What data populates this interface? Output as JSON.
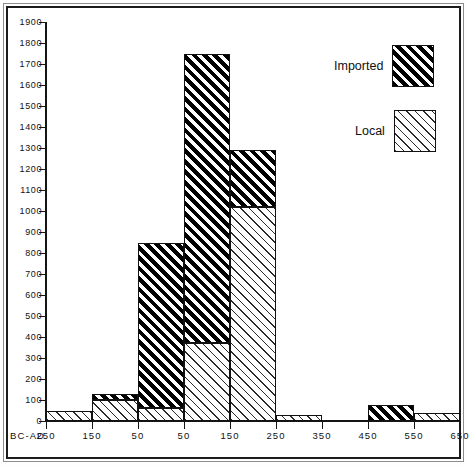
{
  "chart_data": {
    "type": "bar",
    "subtype": "stacked-histogram",
    "title": "",
    "xlabel": "",
    "ylabel": "",
    "axis_prefix_label": "BC-AD",
    "grid": false,
    "ylim": [
      0,
      1900
    ],
    "ytick_step": 100,
    "ytick_labels": [
      "0",
      "100",
      "200",
      "300",
      "400",
      "500",
      "600",
      "700",
      "800",
      "900",
      "1000",
      "1100",
      "1200",
      "1300",
      "1400",
      "1500",
      "1600",
      "1700",
      "1800",
      "1900"
    ],
    "xtick_labels": [
      "250",
      "150",
      "50",
      "50",
      "150",
      "250",
      "350",
      "450",
      "550",
      "650"
    ],
    "categories": [
      "250-150 BC",
      "150-50 BC",
      "50 BC-AD 50",
      "AD 50-150",
      "AD 150-250",
      "AD 250-350",
      "AD 350-450",
      "AD 450-550",
      "AD 550-650"
    ],
    "legend_position": "top-right",
    "series": [
      {
        "name": "Local",
        "fill": "light-diagonal-hatch",
        "values": [
          50,
          100,
          60,
          370,
          1020,
          30,
          0,
          0,
          40
        ]
      },
      {
        "name": "Imported",
        "fill": "dark-diagonal-hatch",
        "values": [
          0,
          30,
          790,
          1380,
          270,
          0,
          0,
          75,
          0
        ]
      }
    ],
    "totals": [
      50,
      130,
      850,
      1750,
      1290,
      30,
      0,
      75,
      40
    ]
  },
  "legend": {
    "items": [
      {
        "label": "Imported",
        "swatch": "dark-hatch-swatch"
      },
      {
        "label": "Local",
        "swatch": "light-hatch-swatch"
      }
    ]
  },
  "colors": {
    "ink": "#111111",
    "paper": "#ffffff",
    "frame": "#8d8d8d"
  }
}
